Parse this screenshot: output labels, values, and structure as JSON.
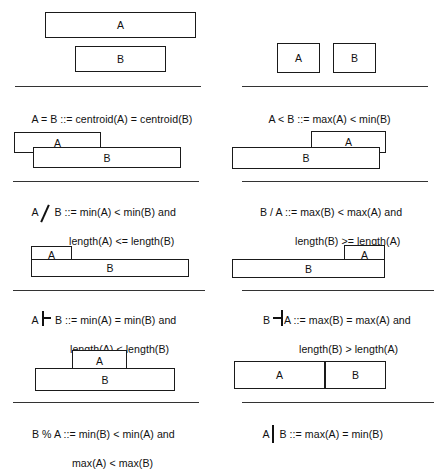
{
  "figure": {
    "box_labels": {
      "a": "A",
      "b": "B"
    },
    "panels": [
      {
        "id": "equals",
        "position": "row1-left",
        "operator_symbol": "=",
        "operator_kind": "text",
        "rule_label": "separator",
        "formula_lines": [
          {
            "lhs": "A = B ::= ",
            "rhs": "centroid(A) = centroid(B)"
          }
        ],
        "formula_plain": "A = B ::= centroid(A) = centroid(B)",
        "boxes": [
          {
            "label": "A",
            "x": 45,
            "y": 12,
            "w": 151,
            "h": 26
          },
          {
            "label": "B",
            "x": 75,
            "y": 46,
            "w": 91,
            "h": 26
          }
        ]
      },
      {
        "id": "less-than",
        "position": "row1-right",
        "operator_symbol": "<",
        "operator_kind": "text",
        "rule_label": "separator",
        "formula_lines": [
          {
            "lhs": "A < B ::= ",
            "rhs": "max(A) < min(B)"
          }
        ],
        "formula_plain": "A < B ::= max(A) < min(B)",
        "boxes": [
          {
            "label": "A",
            "x": 58,
            "y": 43,
            "w": 43,
            "h": 30
          },
          {
            "label": "B",
            "x": 114,
            "y": 43,
            "w": 43,
            "h": 30
          }
        ]
      },
      {
        "id": "backslash",
        "position": "row2-left",
        "operator_symbol": "\\",
        "operator_kind": "backslash",
        "rule_label": "separator",
        "formula_lines": [
          {
            "lhs": "A",
            "op": "\\",
            "mid": " B ::= ",
            "rhs": "min(A) < min(B) and"
          },
          {
            "cont": "length(A) <= length(B)"
          }
        ],
        "formula_plain": "A \\ B ::= min(A) < min(B) and length(A) <= length(B)",
        "boxes": [
          {
            "label": "A",
            "x": 14,
            "y": 12,
            "w": 87,
            "h": 21
          },
          {
            "label": "B",
            "x": 33,
            "y": 27,
            "w": 148,
            "h": 21
          }
        ]
      },
      {
        "id": "slash",
        "position": "row2-right",
        "operator_symbol": "/",
        "operator_kind": "text",
        "rule_label": "separator",
        "formula_lines": [
          {
            "lhs": "B / A ::= ",
            "rhs": "max(B) < max(A) and"
          },
          {
            "cont": "length(B) >= length(A)"
          }
        ],
        "formula_plain": "B / A ::= max(B) < max(A) and length(B) >= length(A)",
        "boxes": [
          {
            "label": "A",
            "x": 92,
            "y": 11,
            "w": 75,
            "h": 22
          },
          {
            "label": "B",
            "x": 13,
            "y": 27,
            "w": 148,
            "h": 22
          }
        ]
      },
      {
        "id": "turnstile",
        "position": "row3-left",
        "operator_symbol": "|-",
        "operator_kind": "turnstile",
        "rule_label": "separator",
        "formula_lines": [
          {
            "lhs": "A ",
            "op": "|-",
            "mid": " B ::= ",
            "rhs": "min(A) = min(B) and"
          },
          {
            "cont": "length(A) < length(B)"
          }
        ],
        "formula_plain": "A |- B ::= min(A) = min(B) and length(A) < length(B)",
        "boxes": [
          {
            "label": "A",
            "x": 31,
            "y": 8,
            "w": 41,
            "h": 18
          },
          {
            "label": "B",
            "x": 31,
            "y": 21,
            "w": 158,
            "h": 18
          }
        ]
      },
      {
        "id": "reverse-turnstile",
        "position": "row3-right",
        "operator_symbol": "=|",
        "operator_kind": "reverse-turnstile",
        "rule_label": "separator",
        "formula_lines": [
          {
            "lhs": "B ",
            "op": "=|",
            "mid": "A ::= ",
            "rhs": "max(B) = max(A) and"
          },
          {
            "cont": "length(B) > length(A)"
          }
        ],
        "formula_plain": "B =| A ::= max(B) = max(A) and length(B) > length(A)",
        "boxes": [
          {
            "label": "A",
            "x": 125,
            "y": 7,
            "w": 41,
            "h": 19
          },
          {
            "label": "B",
            "x": 13,
            "y": 21,
            "w": 153,
            "h": 19
          }
        ]
      },
      {
        "id": "percent",
        "position": "row4-left",
        "operator_symbol": "%",
        "operator_kind": "text",
        "rule_label": "separator",
        "formula_lines": [
          {
            "lhs": "B % A ::= ",
            "rhs": "min(B) < min(A) and"
          },
          {
            "cont": "max(A) < max(B)"
          }
        ],
        "formula_plain": "B % A ::= min(B) < min(A) and max(A) < max(B)",
        "boxes": [
          {
            "label": "A",
            "x": 72,
            "y": 6,
            "w": 55,
            "h": 22
          },
          {
            "label": "B",
            "x": 35,
            "y": 24,
            "w": 140,
            "h": 23
          }
        ]
      },
      {
        "id": "meets",
        "position": "row4-right",
        "operator_symbol": "|",
        "operator_kind": "vbar",
        "rule_label": "separator",
        "formula_lines": [
          {
            "lhs": "A",
            "op": "|",
            "mid": " B ::= ",
            "rhs": "max(A) = min(B)"
          }
        ],
        "formula_plain": "A | B ::= max(A) = min(B)",
        "boxes": [
          {
            "label": "A",
            "x": 15,
            "y": 17,
            "w": 91,
            "h": 28
          },
          {
            "label": "B",
            "x": 106,
            "y": 17,
            "w": 61,
            "h": 28
          }
        ]
      }
    ]
  }
}
